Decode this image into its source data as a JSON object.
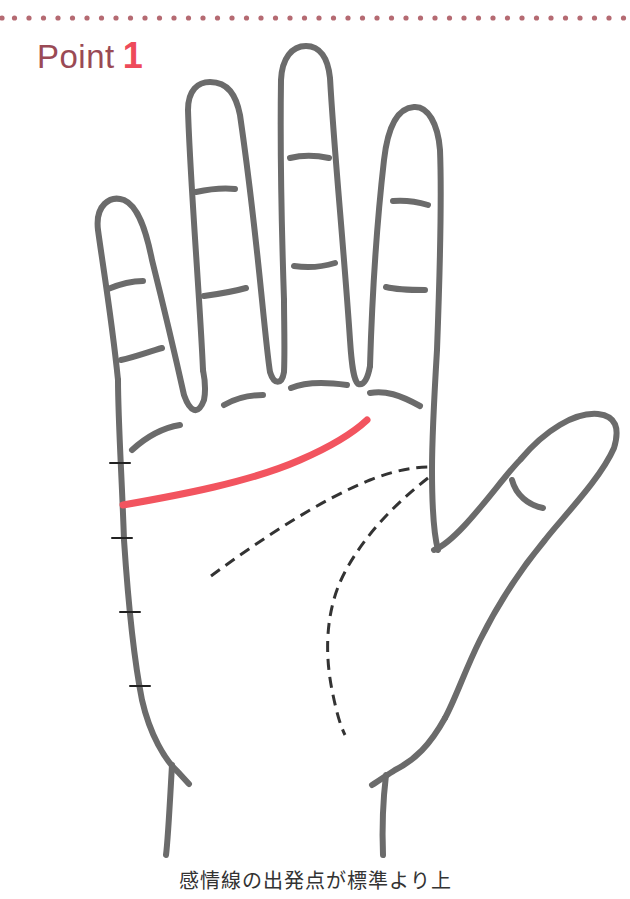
{
  "header": {
    "title_word": "Point",
    "title_number": "1"
  },
  "caption": "感情線の出発点が標準より上",
  "colors": {
    "dots": "#b56a72",
    "title_word": "#9a4a55",
    "title_number": "#ee4a5a",
    "outline": "#6b6b6b",
    "heart_line": "#f2545f",
    "dashed_lines": "#333333",
    "tick_marks": "#222222"
  },
  "diagram": {
    "highlighted_line": "heart-line",
    "dashed_lines": [
      "head-line",
      "life-line"
    ],
    "left_edge_ticks": 4
  }
}
